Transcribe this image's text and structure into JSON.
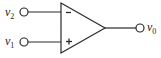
{
  "diagram": {
    "type": "op-amp",
    "inputs": [
      {
        "name": "v",
        "sub": "2",
        "terminal": "inverting",
        "sign": "−"
      },
      {
        "name": "v",
        "sub": "1",
        "terminal": "non-inverting",
        "sign": "+"
      }
    ],
    "output": {
      "name": "v",
      "sub": "0"
    },
    "colors": {
      "stroke": "#2a2a2a",
      "background": "#ffffff"
    }
  }
}
